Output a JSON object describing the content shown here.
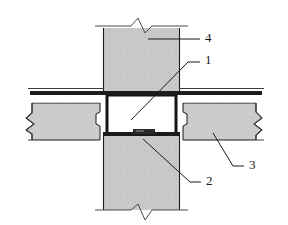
{
  "drawing": {
    "type": "structural-connection-detail",
    "description": "Section detail of a column passing through a floor slab joint",
    "background_color": "#ffffff",
    "line_color": "#1a1a1a",
    "concrete_fill": "#c9c9c9",
    "concrete_fill_light": "#d2d2d2",
    "heavy_line_color": "#111111",
    "cavity_fill": "#ffffff",
    "bearing_pad_color": "#2b2b2b"
  },
  "callouts": [
    {
      "id": "callout-1",
      "label": "1",
      "name": "joint-cavity-callout",
      "text_x": 205,
      "text_y": 61,
      "leader": "M 200 62 L 188 62 L 131 120",
      "target": "central joint cavity"
    },
    {
      "id": "callout-2",
      "label": "2",
      "name": "bearing-pad-callout",
      "text_x": 206,
      "text_y": 182,
      "leader": "M 201 182 L 190 182 L 143 139",
      "target": "bearing pad"
    },
    {
      "id": "callout-3",
      "label": "3",
      "name": "slab-callout",
      "text_x": 249,
      "text_y": 166,
      "leader": "M 244 166 L 233 166 L 213 133",
      "target": "floor slab"
    },
    {
      "id": "callout-4",
      "label": "4",
      "name": "column-callout",
      "text_x": 205,
      "text_y": 39,
      "leader": "M 200 39 L 148 39",
      "target": "column"
    }
  ],
  "geometry": {
    "column": {
      "name": "precast-column",
      "left": 103,
      "right": 180,
      "top": 25,
      "bottom": 212
    },
    "slab_left": {
      "name": "left-floor-slab",
      "left": 30,
      "right": 104,
      "top": 103,
      "bottom": 140
    },
    "slab_right": {
      "name": "right-floor-slab",
      "left": 179,
      "right": 262,
      "top": 103,
      "bottom": 140
    },
    "topping_band": {
      "name": "topping-slab-band",
      "top": 91,
      "bottom": 95
    },
    "cavity": {
      "name": "joint-cavity",
      "left": 107,
      "right": 176,
      "top": 95,
      "bottom": 134
    },
    "bearing_pad": {
      "name": "bearing-pad",
      "left": 133,
      "right": 155,
      "top": 131,
      "bottom": 136
    },
    "break_lines": [
      {
        "name": "break-line-top",
        "orientation": "horizontal"
      },
      {
        "name": "break-line-bottom",
        "orientation": "horizontal"
      },
      {
        "name": "break-line-left",
        "orientation": "vertical"
      },
      {
        "name": "break-line-right",
        "orientation": "vertical"
      }
    ]
  }
}
